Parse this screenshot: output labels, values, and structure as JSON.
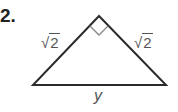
{
  "problem": {
    "number": "2."
  },
  "figure": {
    "type": "isosceles right triangle",
    "vertices": {
      "apex": [
        99,
        16
      ],
      "base_left": [
        33,
        85
      ],
      "base_right": [
        166,
        85
      ]
    },
    "right_angle_marker": true,
    "stroke_color": "#2b2b2b",
    "marker_color": "#888888",
    "labels": {
      "left_leg": {
        "radical": "√",
        "radicand": "2"
      },
      "right_leg": {
        "radical": "√",
        "radicand": "2"
      },
      "base": "y"
    }
  }
}
